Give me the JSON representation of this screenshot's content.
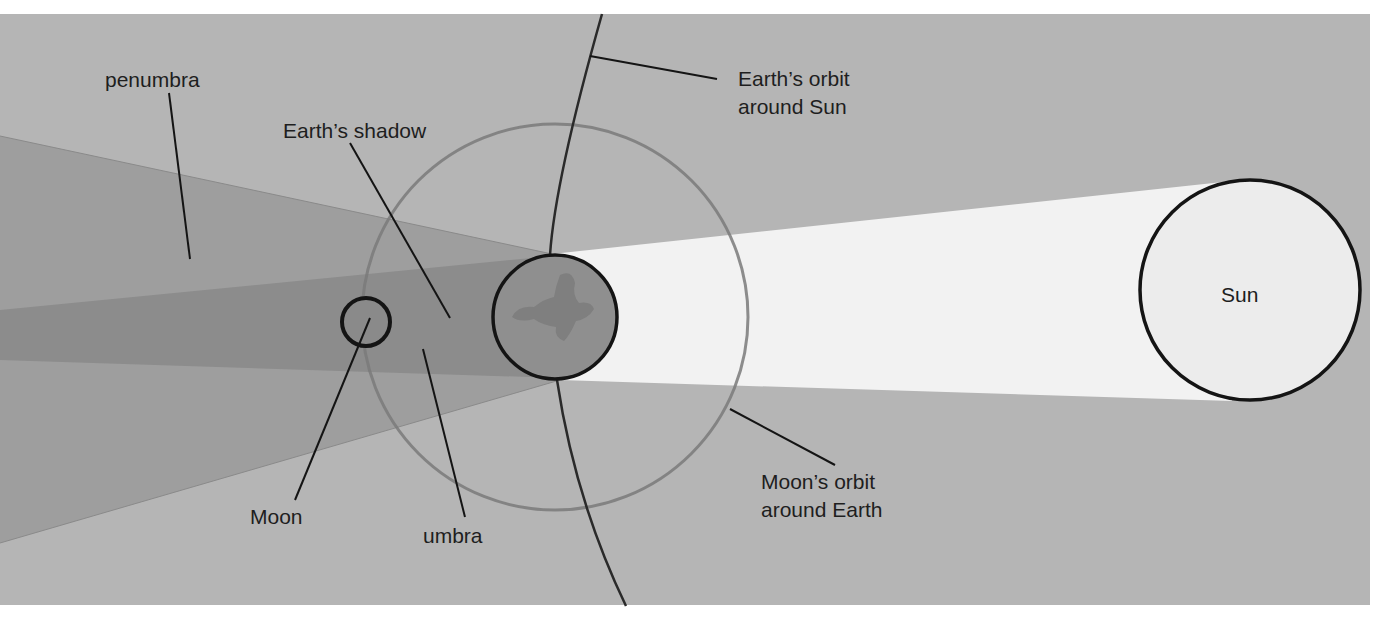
{
  "colors": {
    "page_background": "#ffffff",
    "space_background": "#b5b5b5",
    "sunlight_beam": "#f2f2f2",
    "penumbra": "#9c9c9c",
    "umbra": "#8a8a8a",
    "earth_fill": "#8f8f8f",
    "sun_fill": "#ececec",
    "outline": "#141414",
    "orbit_line": "#7c7c7c"
  },
  "labels": {
    "penumbra": "penumbra",
    "earths_shadow": "Earth’s shadow",
    "earth_orbit_line1": "Earth’s orbit",
    "earth_orbit_line2": "around Sun",
    "sun": "Sun",
    "moon_orbit_line1": "Moon’s orbit",
    "moon_orbit_line2": "around Earth",
    "moon": "Moon",
    "umbra": "umbra"
  },
  "bodies": {
    "sun": {
      "cx": 1250,
      "cy": 290,
      "r": 110
    },
    "earth": {
      "cx": 555,
      "cy": 317,
      "r": 62
    },
    "moon": {
      "cx": 366,
      "cy": 322,
      "r": 24
    },
    "moon_orbit": {
      "cx": 555,
      "cy": 317,
      "r": 193
    }
  }
}
